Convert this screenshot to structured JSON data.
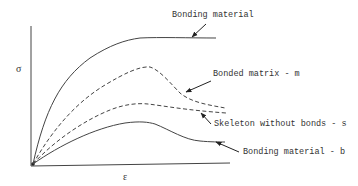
{
  "axes": {
    "y_label": "σ",
    "x_label": "ε"
  },
  "curves": [
    {
      "id": "bonding-material",
      "label": "Bonding material",
      "style": "solid"
    },
    {
      "id": "bonded-matrix",
      "label": "Bonded matrix - m",
      "style": "dashed"
    },
    {
      "id": "skeleton",
      "label": "Skeleton without bonds - s",
      "style": "dashed"
    },
    {
      "id": "bonding-material-b",
      "label": "Bonding material - b",
      "style": "solid"
    }
  ]
}
